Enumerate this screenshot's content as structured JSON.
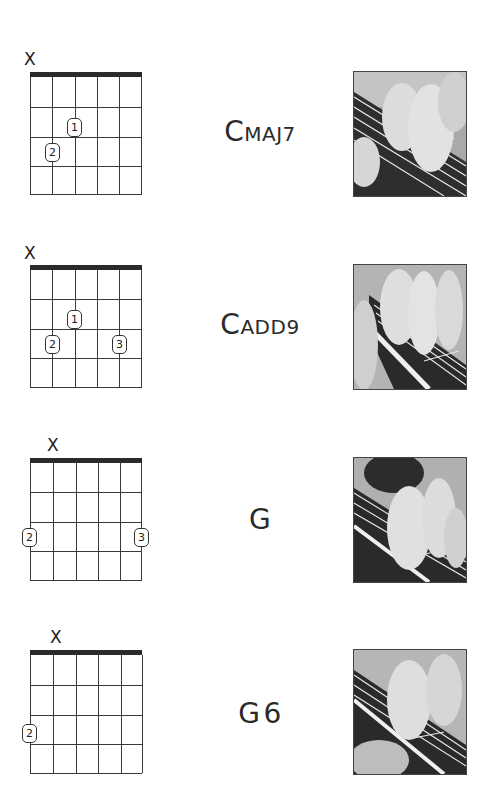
{
  "chords": [
    {
      "name_initial": "C",
      "name_rest": "MAJ7",
      "name_full": "Cmaj7",
      "muted_strings": [
        1
      ],
      "fingers": [
        {
          "finger": "1",
          "string": 3,
          "fret": 2
        },
        {
          "finger": "2",
          "string": 2,
          "fret": 3
        }
      ],
      "photo_alt": "hand-fretting-cmaj7-photo"
    },
    {
      "name_initial": "C",
      "name_rest": "ADD9",
      "name_full": "Cadd9",
      "muted_strings": [
        1
      ],
      "fingers": [
        {
          "finger": "1",
          "string": 3,
          "fret": 2
        },
        {
          "finger": "2",
          "string": 2,
          "fret": 3
        },
        {
          "finger": "3",
          "string": 5,
          "fret": 3
        }
      ],
      "photo_alt": "hand-fretting-cadd9-photo"
    },
    {
      "name_initial": "G",
      "name_rest": "",
      "name_full": "G",
      "muted_strings": [
        2
      ],
      "fingers": [
        {
          "finger": "2",
          "string": 1,
          "fret": 3
        },
        {
          "finger": "3",
          "string": 6,
          "fret": 3
        }
      ],
      "photo_alt": "hand-fretting-g-photo"
    },
    {
      "name_initial": "G",
      "name_rest": "6",
      "name_full": "G6",
      "muted_strings": [
        2
      ],
      "fingers": [
        {
          "finger": "2",
          "string": 1,
          "fret": 3
        }
      ],
      "photo_alt": "hand-fretting-g6-photo"
    }
  ],
  "mute_symbol": "X",
  "colors": {
    "nut": "#2b2b2b",
    "grid": "#3a3a3a",
    "text": "#2a2a2a",
    "background": "#ffffff"
  }
}
